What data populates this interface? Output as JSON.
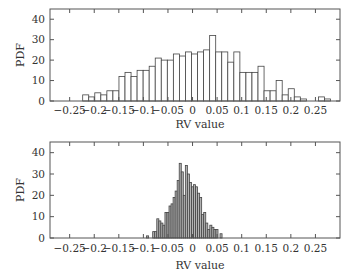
{
  "chart_data": [
    {
      "type": "bar",
      "subtype": "histogram",
      "title": "",
      "xlabel": "RV value",
      "ylabel": "PDF",
      "xlim": [
        -0.29,
        0.3
      ],
      "ylim": [
        0,
        45
      ],
      "xticks": [
        -0.25,
        -0.2,
        -0.15,
        -0.1,
        -0.05,
        0,
        0.05,
        0.1,
        0.15,
        0.2,
        0.25
      ],
      "xtick_labels": [
        "−0.25",
        "−0.2",
        "−0.15",
        "−0.1",
        "−0.05",
        "0",
        "0.05",
        "0.1",
        "0.15",
        "0.2",
        "0.25"
      ],
      "yticks": [
        0,
        10,
        20,
        30,
        40
      ],
      "ytick_labels": [
        "0",
        "10",
        "20",
        "30",
        "40"
      ],
      "grid": false,
      "bar_fill": "#ffffff",
      "bar_stroke": "#444444",
      "bin_width": 0.0123,
      "bin_start": -0.2235,
      "values": [
        3,
        2,
        4,
        3,
        5,
        5,
        12,
        14,
        12,
        15,
        15,
        17,
        21,
        20,
        20,
        23,
        22,
        24,
        23,
        24,
        25,
        32,
        24,
        24,
        19,
        24,
        14,
        14,
        14,
        17,
        5,
        5,
        10,
        3,
        6,
        2,
        1,
        0,
        0,
        2,
        1
      ]
    },
    {
      "type": "bar",
      "subtype": "histogram",
      "title": "",
      "xlabel": "RV value",
      "ylabel": "PDF",
      "xlim": [
        -0.29,
        0.3
      ],
      "ylim": [
        0,
        45
      ],
      "xticks": [
        -0.25,
        -0.2,
        -0.15,
        -0.1,
        -0.05,
        0,
        0.05,
        0.1,
        0.15,
        0.2,
        0.25
      ],
      "xtick_labels": [
        "−0.25",
        "−0.2",
        "−0.15",
        "−0.1",
        "−0.05",
        "0",
        "0.05",
        "0.1",
        "0.15",
        "0.2",
        "0.25"
      ],
      "yticks": [
        0,
        10,
        20,
        30,
        40
      ],
      "ytick_labels": [
        "0",
        "10",
        "20",
        "30",
        "40"
      ],
      "grid": false,
      "bar_fill": "#b4b4b4",
      "bar_stroke": "#444444",
      "bin_width": 0.00415,
      "bin_start": -0.0935,
      "values": [
        1,
        0,
        0,
        3,
        3,
        9,
        8,
        7,
        6,
        12,
        12,
        15,
        16,
        19,
        22,
        27,
        35,
        31,
        20,
        34,
        30,
        26,
        24,
        25,
        24,
        21,
        19,
        11,
        12,
        7,
        4,
        6,
        5,
        4,
        4,
        0,
        2
      ]
    }
  ]
}
